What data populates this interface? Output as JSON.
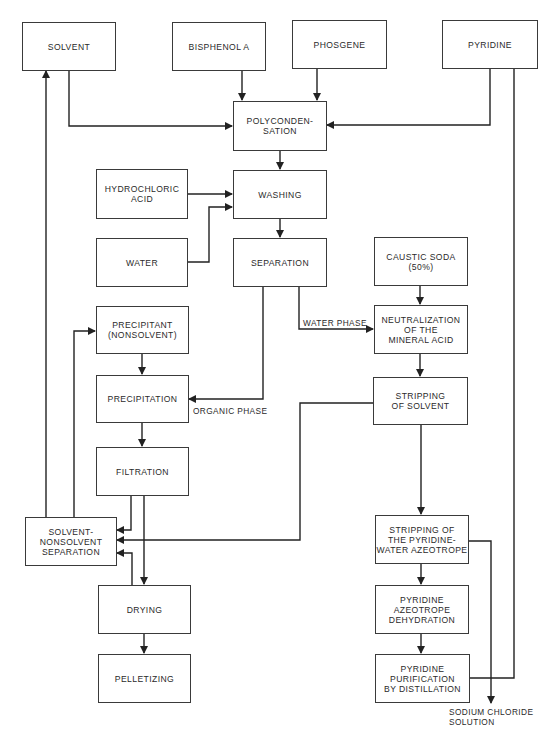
{
  "diagram": {
    "type": "process-flow",
    "nodes": {
      "solvent": "SOLVENT",
      "bisphenol_a": "BISPHENOL A",
      "phosgene": "PHOSGENE",
      "pyridine": "PYRIDINE",
      "polycondensation": "POLYCONDEN-\nSATION",
      "hydrochloric_acid": "HYDROCHLORIC\nACID",
      "washing": "WASHING",
      "water": "WATER",
      "separation": "SEPARATION",
      "caustic_soda": "CAUSTIC SODA\n(50%)",
      "neutralization": "NEUTRALIZATION\nOF THE\nMINERAL ACID",
      "precipitant": "PRECIPITANT\n(NONSOLVENT)",
      "precipitation": "PRECIPITATION",
      "stripping_solvent": "STRIPPING\nOF SOLVENT",
      "filtration": "FILTRATION",
      "solvent_nonsolvent_separation": "SOLVENT-\nNONSOLVENT\nSEPARATION",
      "stripping_pyridine_water": "STRIPPING OF\nTHE PYRIDINE-\nWATER AZEOTROPE",
      "drying": "DRYING",
      "pyridine_azeotrope_dehydration": "PYRIDINE\nAZEOTROPE\nDEHYDRATION",
      "pelletizing": "PELLETIZING",
      "pyridine_purification": "PYRIDINE\nPURIFICATION\nBY DISTILLATION"
    },
    "labels": {
      "water_phase": "WATER PHASE",
      "organic_phase": "ORGANIC PHASE",
      "sodium_chloride": "SODIUM CHLORIDE\n SOLUTION"
    },
    "edges": [
      [
        "solvent",
        "polycondensation"
      ],
      [
        "bisphenol_a",
        "polycondensation"
      ],
      [
        "phosgene",
        "polycondensation"
      ],
      [
        "pyridine",
        "polycondensation"
      ],
      [
        "polycondensation",
        "washing"
      ],
      [
        "hydrochloric_acid",
        "washing"
      ],
      [
        "water",
        "washing"
      ],
      [
        "washing",
        "separation"
      ],
      [
        "separation",
        "neutralization",
        "WATER PHASE"
      ],
      [
        "separation",
        "precipitation",
        "ORGANIC PHASE"
      ],
      [
        "caustic_soda",
        "neutralization"
      ],
      [
        "neutralization",
        "stripping_solvent"
      ],
      [
        "precipitant",
        "precipitation"
      ],
      [
        "precipitation",
        "filtration"
      ],
      [
        "filtration",
        "solvent_nonsolvent_separation"
      ],
      [
        "filtration",
        "drying"
      ],
      [
        "stripping_solvent",
        "solvent_nonsolvent_separation"
      ],
      [
        "stripping_solvent",
        "stripping_pyridine_water"
      ],
      [
        "drying",
        "solvent_nonsolvent_separation"
      ],
      [
        "solvent_nonsolvent_separation",
        "solvent"
      ],
      [
        "solvent_nonsolvent_separation",
        "precipitant"
      ],
      [
        "drying",
        "pelletizing"
      ],
      [
        "stripping_pyridine_water",
        "pyridine_azeotrope_dehydration"
      ],
      [
        "stripping_pyridine_water",
        "sodium_chloride_solution"
      ],
      [
        "pyridine_azeotrope_dehydration",
        "pyridine_purification"
      ],
      [
        "pyridine_purification",
        "pyridine"
      ]
    ]
  }
}
